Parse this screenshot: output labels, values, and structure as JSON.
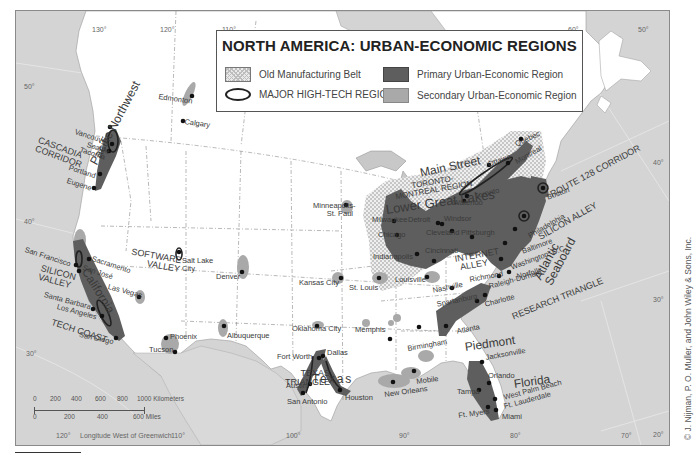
{
  "map": {
    "title": "NORTH AMERICA: URBAN-ECONOMIC REGIONS",
    "colors": {
      "ocean": "#d4d4d4",
      "land": "#ffffff",
      "primary_region": "#5e5e5e",
      "secondary_region": "#a9a9a9",
      "manufacturing_belt": "#e4e4e4",
      "city_dot": "#111111"
    },
    "legend": {
      "items": [
        {
          "swatch": "crosshatch",
          "label": "Old Manufacturing Belt"
        },
        {
          "swatch": "oval-outline",
          "label": "MAJOR HIGH-TECH REGION"
        },
        {
          "swatch": "dark-fill",
          "label": "Primary Urban-Economic Region"
        },
        {
          "swatch": "medium-fill",
          "label": "Secondary Urban-Economic Region"
        }
      ]
    },
    "graticule": {
      "longitudes_top": [
        "130°",
        "120°",
        "110°",
        "100°",
        "90°",
        "80°",
        "70°",
        "60°",
        "50°"
      ],
      "longitudes_bottom": [
        "120°",
        "110°",
        "100°",
        "90°",
        "80°",
        "70°"
      ],
      "latitudes_left": [
        "50°",
        "40°",
        "30°"
      ],
      "latitudes_right": [
        "50°",
        "40°",
        "30°",
        "20°"
      ],
      "bottom_caption": "Longitude West of Greenwich"
    },
    "scale_bar": {
      "km_ticks": [
        "0",
        "200",
        "400",
        "600",
        "800",
        "1000 Kilometers"
      ],
      "mile_ticks": [
        "0",
        "200",
        "400",
        "600 Miles"
      ]
    },
    "regions": [
      "Pacific Northwest",
      "California",
      "Texas",
      "Lower Great Lakes",
      "Main Street",
      "Atlantic Seaboard",
      "Piedmont",
      "Florida"
    ],
    "high_tech_regions": [
      "CASCADIA CORRIDOR",
      "SILICON VALLEY",
      "TECH COAST",
      "SOFTWARE VALLEY",
      "TEXAS TRIANGLE",
      "TORONTO-MONTREAL REGION",
      "ROUTE 128 CORRIDOR",
      "SILICON ALLEY",
      "INTERNET ALLEY",
      "RESEARCH TRIANGLE"
    ],
    "cities": [
      "Vancouver",
      "Seattle",
      "Tacoma",
      "Portland",
      "Eugene",
      "Edmonton",
      "Calgary",
      "San Francisco",
      "Sacramento",
      "San José",
      "Santa Barbara",
      "Los Angeles",
      "San Diego",
      "Las Vegas",
      "Phoenix",
      "Tucson",
      "Salt Lake City",
      "Denver",
      "Albuquerque",
      "Minneapolis-St. Paul",
      "Kansas City",
      "St. Louis",
      "Oklahoma City",
      "Memphis",
      "Fort Worth",
      "Dallas",
      "Austin",
      "San Antonio",
      "Houston",
      "New Orleans",
      "Mobile",
      "Milwaukee",
      "Chicago",
      "Indianapolis",
      "Louisville",
      "Detroit",
      "Windsor",
      "Cleveland",
      "Cincinnati",
      "Pittsburgh",
      "Toronto",
      "Waterloo",
      "Ottawa",
      "Montreal",
      "Quebec",
      "Boston",
      "New York",
      "Philadelphia",
      "Baltimore",
      "Washington, D.C.",
      "Richmond",
      "Norfolk",
      "Raleigh-Durham",
      "Charlotte",
      "Spartanburg",
      "Atlanta",
      "Nashville",
      "Birmingham",
      "Jacksonville",
      "Orlando",
      "Tampa",
      "Ft. Myers",
      "West Palm Beach",
      "Ft. Lauderdale",
      "Miami"
    ],
    "copyright": "© J. Nijman, P. O. Muller, and John Wiley & Sons, Inc."
  }
}
